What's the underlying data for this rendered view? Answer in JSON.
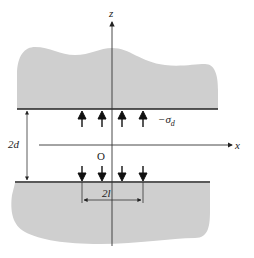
{
  "diagram": {
    "type": "crack-geometry",
    "axes": {
      "x_label": "x",
      "z_label": "z",
      "origin_label": "O"
    },
    "dimensions": {
      "gap_label": "2d",
      "load_width_label": "2l"
    },
    "load": {
      "label": "−σ",
      "label_subscript": "d",
      "upper_arrows_direction": "up",
      "lower_arrows_direction": "down",
      "arrow_count_per_side": 4
    },
    "colors": {
      "solid_fill": "#cfcfcf",
      "line": "#222222",
      "background": "#ffffff"
    }
  }
}
